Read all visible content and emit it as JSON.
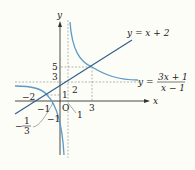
{
  "diagram": {
    "type": "function-graph",
    "axes": {
      "x_label": "x",
      "y_label": "y",
      "origin_label": "O"
    },
    "curves": [
      {
        "name": "line",
        "equation": "y = x + 2",
        "label": "y = x + 2",
        "color": "#2f5d8a"
      },
      {
        "name": "hyperbola",
        "equation": "y = (3x+1)/(x-1)",
        "label_lhs": "y =",
        "label_num": "3x + 1",
        "label_den": "x − 1",
        "color": "#5b9bc8"
      }
    ],
    "asymptotes": {
      "vertical": "x = 1",
      "horizontal": "y = 3"
    },
    "intersections": [
      {
        "x": 3,
        "y": 5
      },
      {
        "x": -1,
        "y": 1
      }
    ],
    "tick_labels": {
      "x": [
        "−2",
        "−1",
        "1",
        "3"
      ],
      "y": [
        "5",
        "3",
        "2",
        "1",
        "−1"
      ],
      "x_intercept_frac_num": "1",
      "x_intercept_frac_den": "3",
      "x_intercept_sign": "−"
    },
    "colors": {
      "axis": "#333333",
      "dashed": "#777777",
      "line": "#2f5d8a",
      "hyperbola": "#5b9bc8"
    }
  }
}
